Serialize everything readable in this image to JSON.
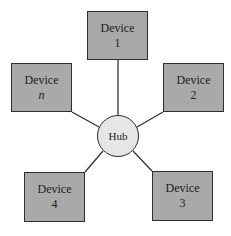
{
  "diagram": {
    "type": "star-topology",
    "hub": {
      "label": "Hub"
    },
    "devices": [
      {
        "id": "1",
        "label": "Device",
        "number": "1",
        "italic": false
      },
      {
        "id": "2",
        "label": "Device",
        "number": "2",
        "italic": false
      },
      {
        "id": "3",
        "label": "Device",
        "number": "3",
        "italic": false
      },
      {
        "id": "4",
        "label": "Device",
        "number": "4",
        "italic": false
      },
      {
        "id": "n",
        "label": "Device",
        "number": "n",
        "italic": true
      }
    ],
    "colors": {
      "device_fill": "#a9a9a9",
      "hub_fill": "#e6e6e6",
      "stroke": "#2f2f2f"
    }
  }
}
